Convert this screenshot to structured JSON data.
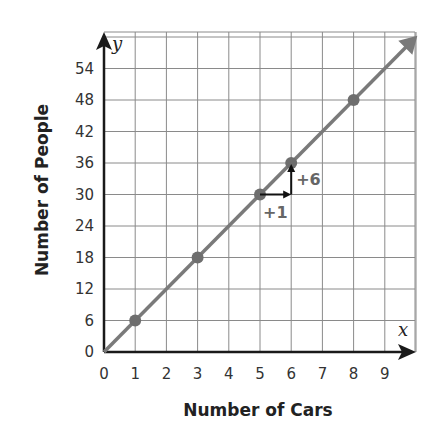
{
  "chart_data": {
    "type": "line",
    "title": "",
    "xlabel": "Number of Cars",
    "ylabel": "Number of People",
    "x_axis_var": "x",
    "y_axis_var": "y",
    "xlim": [
      0,
      10
    ],
    "ylim": [
      0,
      60
    ],
    "x_ticks": [
      "0",
      "1",
      "2",
      "3",
      "4",
      "5",
      "6",
      "7",
      "8",
      "9"
    ],
    "y_ticks": [
      "0",
      "6",
      "12",
      "18",
      "24",
      "30",
      "36",
      "42",
      "48",
      "54"
    ],
    "grid": true,
    "legend": null,
    "series": [
      {
        "name": "People = 6 × Cars",
        "line": {
          "slope": 6,
          "intercept": 0
        },
        "points": [
          {
            "x": 1,
            "y": 6
          },
          {
            "x": 3,
            "y": 18
          },
          {
            "x": 5,
            "y": 30
          },
          {
            "x": 6,
            "y": 36
          },
          {
            "x": 8,
            "y": 48
          }
        ]
      }
    ],
    "annotations": [
      {
        "text": "+1",
        "type": "run-arrow",
        "from": [
          5,
          30
        ],
        "to": [
          6,
          30
        ]
      },
      {
        "text": "+6",
        "type": "rise-arrow",
        "from": [
          6,
          30
        ],
        "to": [
          6,
          36
        ]
      }
    ]
  },
  "colors": {
    "line": "#7a7a7a",
    "points": "#6e6e6e",
    "grid": "#8a8a8a",
    "axis": "#1a1a1a",
    "annotation_text": "#666666"
  }
}
